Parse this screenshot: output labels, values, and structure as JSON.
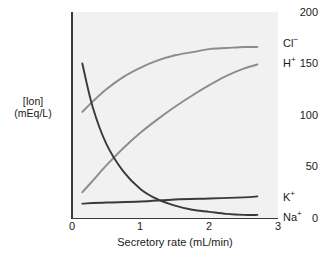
{
  "chart_data": {
    "type": "line",
    "title": "",
    "xlabel": "Secretory rate (mL/min)",
    "ylabel": "[Ion] (mEq/L)",
    "ylabel_line1": "[Ion]",
    "ylabel_line2": "(mEq/L)",
    "xlim": [
      0,
      3
    ],
    "ylim": [
      0,
      200
    ],
    "xticks": [
      "0",
      "1",
      "2",
      "3"
    ],
    "xtick_values": [
      0,
      1,
      2,
      3
    ],
    "yticks": [
      "0",
      "50",
      "100",
      "150",
      "200"
    ],
    "ytick_values": [
      0,
      50,
      100,
      150,
      200
    ],
    "grid": false,
    "legend_position": "right-inline",
    "series": [
      {
        "name": "Cl⁻",
        "label_html": "Cl<sup>−</sup>",
        "color": "#8c8c8c",
        "x": [
          0.15,
          0.3,
          0.5,
          0.75,
          1.0,
          1.25,
          1.5,
          1.75,
          2.0,
          2.25,
          2.5,
          2.7
        ],
        "values": [
          103,
          113,
          125,
          137,
          146,
          153,
          158,
          161,
          164,
          165,
          166,
          166
        ]
      },
      {
        "name": "H⁺",
        "label_html": "H<sup>+</sup>",
        "color": "#8c8c8c",
        "x": [
          0.15,
          0.3,
          0.5,
          0.75,
          1.0,
          1.25,
          1.5,
          1.75,
          2.0,
          2.25,
          2.5,
          2.7
        ],
        "values": [
          25,
          36,
          51,
          68,
          83,
          96,
          108,
          119,
          129,
          138,
          145,
          149
        ]
      },
      {
        "name": "K⁺",
        "label_html": "K<sup>+</sup>",
        "color": "#3a3a3a",
        "x": [
          0.15,
          0.5,
          1.0,
          1.5,
          2.0,
          2.5,
          2.7
        ],
        "values": [
          14,
          15,
          16,
          18,
          19,
          20,
          21
        ]
      },
      {
        "name": "Na⁺",
        "label_html": "Na<sup>+</sup>",
        "color": "#3a3a3a",
        "x": [
          0.15,
          0.3,
          0.5,
          0.75,
          1.0,
          1.25,
          1.5,
          1.75,
          2.0,
          2.25,
          2.5,
          2.7
        ],
        "values": [
          150,
          108,
          72,
          45,
          28,
          18,
          12,
          8,
          6,
          4,
          3,
          3
        ]
      }
    ],
    "series_labels": [
      {
        "text": "Cl⁻",
        "top": 38,
        "left": 283
      },
      {
        "text": "H⁺",
        "top": 58,
        "left": 283
      },
      {
        "text": "K⁺",
        "top": 192,
        "left": 283
      },
      {
        "text": "Na⁺",
        "top": 212,
        "left": 283
      }
    ],
    "colors": {
      "plot_background": "#f1f1f1",
      "axis": "#3a3a3a",
      "light_series": "#8c8c8c",
      "dark_series": "#3a3a3a",
      "text": "#1a1a1a"
    }
  }
}
